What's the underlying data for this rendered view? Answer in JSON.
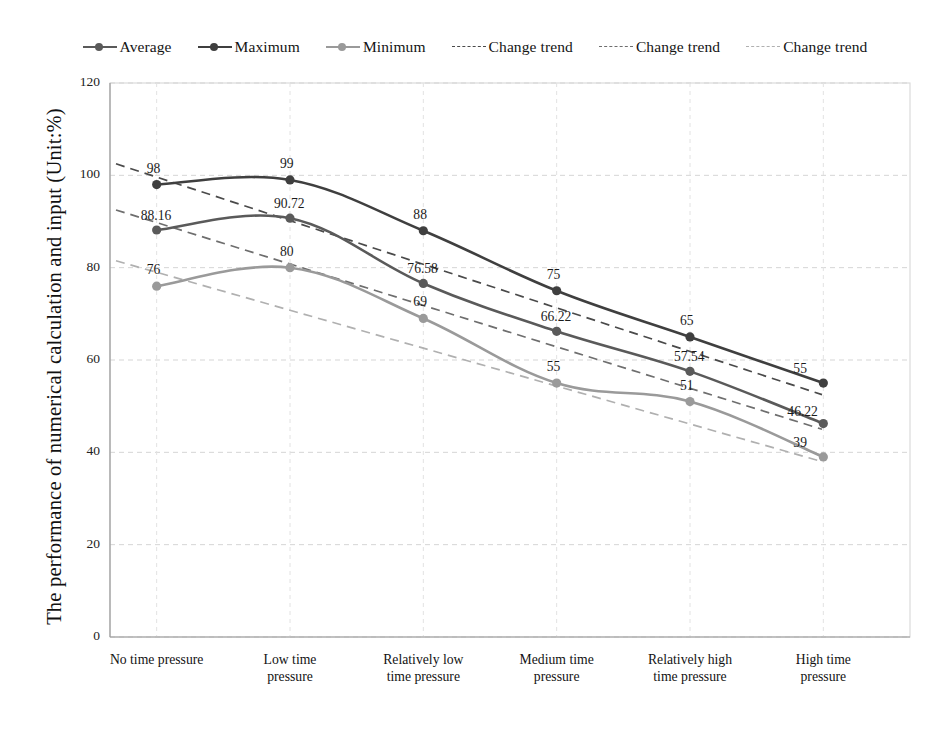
{
  "legend": {
    "items": [
      {
        "label": "Average",
        "style": "solid-marker",
        "color": "#5a5a5a",
        "icon": "line-marker-icon"
      },
      {
        "label": "Maximum",
        "style": "solid-marker",
        "color": "#3f3f3f",
        "icon": "line-marker-icon"
      },
      {
        "label": "Minimum",
        "style": "solid-marker",
        "color": "#9a9a9a",
        "icon": "line-marker-icon"
      },
      {
        "label": "Change trend",
        "style": "dashed",
        "color": "#4a4a4a",
        "icon": "dashed-line-icon"
      },
      {
        "label": "Change trend",
        "style": "dashed",
        "color": "#6e6e6e",
        "icon": "dashed-line-icon"
      },
      {
        "label": "Change trend",
        "style": "dashed",
        "color": "#b0b0b0",
        "icon": "dashed-line-icon"
      }
    ]
  },
  "chart_data": {
    "type": "line",
    "title": "",
    "xlabel": "",
    "ylabel": "The performance of numerical calculation and input (Unit:%)",
    "ylim": [
      0,
      120
    ],
    "yticks": [
      0,
      20,
      40,
      60,
      80,
      100,
      120
    ],
    "grid": true,
    "legend_position": "top",
    "categories": [
      "No time pressure",
      "Low time pressure",
      "Relatively low time pressure",
      "Medium time pressure",
      "Relatively high time pressure",
      "High time pressure"
    ],
    "series": [
      {
        "name": "Maximum",
        "color": "#3f3f3f",
        "values": [
          98,
          99,
          88,
          75,
          65,
          55
        ],
        "labels": [
          "98",
          "99",
          "88",
          "75",
          "65",
          "55"
        ]
      },
      {
        "name": "Average",
        "color": "#5a5a5a",
        "values": [
          88.16,
          90.72,
          76.58,
          66.22,
          57.54,
          46.22
        ],
        "labels": [
          "88.16",
          "90.72",
          "76.58",
          "66.22",
          "57.54",
          "46.22"
        ]
      },
      {
        "name": "Minimum",
        "color": "#9a9a9a",
        "values": [
          76,
          80,
          69,
          55,
          51,
          39
        ],
        "labels": [
          "76",
          "80",
          "69",
          "55",
          "51",
          "39"
        ]
      }
    ],
    "trendlines": [
      {
        "name": "Change trend",
        "for_series": "Maximum",
        "color": "#4a4a4a",
        "start": 102.5,
        "end": 52.5
      },
      {
        "name": "Change trend",
        "for_series": "Average",
        "color": "#6e6e6e",
        "start": 92.5,
        "end": 45.0
      },
      {
        "name": "Change trend",
        "for_series": "Minimum",
        "color": "#b0b0b0",
        "start": 81.5,
        "end": 38.0
      }
    ]
  }
}
